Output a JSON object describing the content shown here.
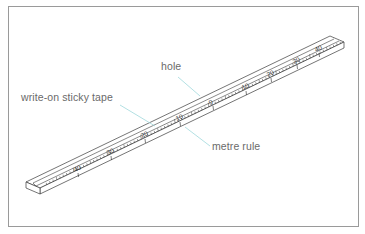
{
  "diagram": {
    "labels": {
      "hole": "hole",
      "tape": "write-on sticky tape",
      "rule": "metre rule"
    },
    "scale_marks": [
      {
        "text": "40",
        "x": 75,
        "y": 172
      },
      {
        "text": "30",
        "x": 108,
        "y": 155
      },
      {
        "text": "20",
        "x": 142,
        "y": 138
      },
      {
        "text": "10",
        "x": 177,
        "y": 121
      },
      {
        "text": "0",
        "x": 210,
        "y": 105
      },
      {
        "text": "10",
        "x": 243,
        "y": 90
      },
      {
        "text": "20",
        "x": 268,
        "y": 77
      },
      {
        "text": "30",
        "x": 294,
        "y": 64
      },
      {
        "text": "40",
        "x": 316,
        "y": 52
      }
    ],
    "colors": {
      "line": "#3a3a3a",
      "leader": "#9fd8dc",
      "label_text": "#6a6a6a",
      "frame": "#9a9a9a"
    }
  }
}
